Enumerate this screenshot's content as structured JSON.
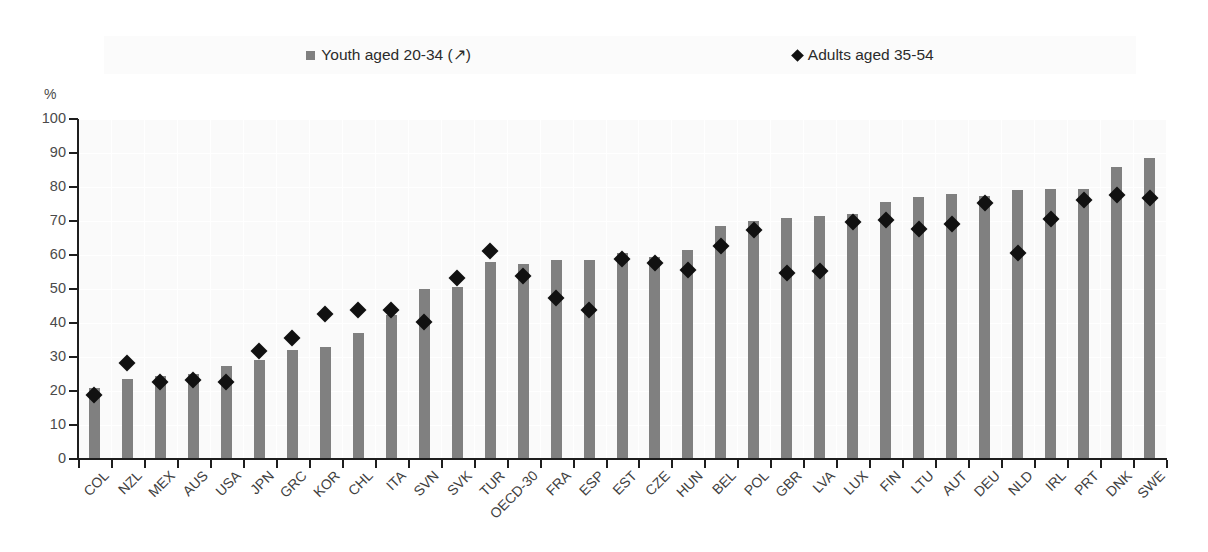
{
  "legend": {
    "position": "top-center",
    "entries": [
      {
        "label": "Youth aged 20-34 (↗)",
        "marker": "square",
        "color": "#808080",
        "name": "legend-youth"
      },
      {
        "label": "Adults aged 35-54",
        "marker": "diamond",
        "color": "#111111",
        "name": "legend-adults"
      }
    ]
  },
  "axis": {
    "y_unit": "%",
    "y_ticks": [
      0,
      10,
      20,
      30,
      40,
      50,
      60,
      70,
      80,
      90,
      100
    ]
  },
  "colors": {
    "bar": "#808080",
    "marker": "#111111",
    "plot_background": "#fafafa",
    "gridline": "#ffffff",
    "axis": "#1e1e1e",
    "text": "#3f3f3f"
  },
  "chart_data": {
    "type": "bar",
    "title": "",
    "subtitle": "",
    "xlabel": "",
    "ylabel": "%",
    "ylim": [
      0,
      100
    ],
    "grid": true,
    "legend_position": "top-center",
    "categories": [
      "COL",
      "NZL",
      "MEX",
      "AUS",
      "USA",
      "JPN",
      "GRC",
      "KOR",
      "CHL",
      "ITA",
      "SVN",
      "SVK",
      "TUR",
      "OECD-30",
      "FRA",
      "ESP",
      "EST",
      "CZE",
      "HUN",
      "BEL",
      "POL",
      "GBR",
      "LVA",
      "LUX",
      "FIN",
      "LTU",
      "AUT",
      "DEU",
      "NLD",
      "IRL",
      "PRT",
      "DNK",
      "SWE"
    ],
    "series": [
      {
        "name": "Youth aged 20-34 (↗)",
        "type": "bar",
        "color": "#808080",
        "values": [
          21.0,
          23.5,
          24.5,
          25.0,
          27.5,
          29.0,
          32.0,
          33.0,
          37.0,
          42.5,
          50.0,
          50.5,
          58.0,
          57.5,
          58.5,
          58.5,
          60.5,
          59.5,
          61.5,
          68.5,
          70.0,
          71.0,
          71.5,
          72.0,
          75.5,
          77.0,
          78.0,
          77.5,
          79.0,
          79.5,
          79.5,
          86.0,
          88.5
        ]
      },
      {
        "name": "Adults aged 35-54",
        "type": "scatter",
        "color": "#111111",
        "values": [
          20.5,
          30.0,
          24.5,
          25.0,
          24.5,
          33.5,
          37.5,
          44.5,
          45.5,
          45.5,
          42.0,
          55.0,
          63.0,
          55.5,
          49.0,
          45.5,
          60.5,
          59.5,
          57.5,
          64.5,
          69.0,
          56.5,
          57.0,
          71.5,
          72.0,
          69.5,
          71.0,
          77.0,
          62.5,
          72.5,
          78.0,
          79.5,
          78.5
        ]
      }
    ]
  }
}
